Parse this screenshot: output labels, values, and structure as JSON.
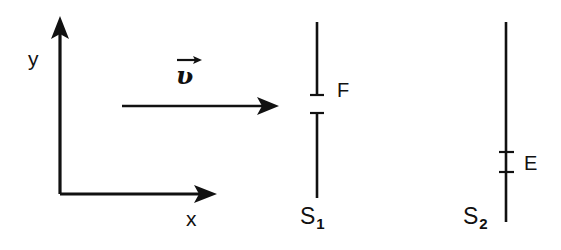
{
  "figure": {
    "kind": "physics-optics-diagram",
    "stroke_color": "#111111",
    "background_color": "#ffffff",
    "axes": {
      "y_label": "y",
      "x_label": "x",
      "origin": {
        "x": 60,
        "y": 194
      },
      "y_tip": {
        "x": 60,
        "y": 18
      },
      "x_tip": {
        "x": 215,
        "y": 194
      }
    },
    "vector": {
      "symbol": "ʋ",
      "accent": "right-arrow-overbar",
      "label_x": 176,
      "label_y": 57,
      "ray": {
        "x1": 122,
        "y1": 106,
        "x2": 277,
        "y2": 106
      }
    },
    "screens": [
      {
        "name": "S1",
        "label": "S",
        "subscript": "1",
        "line_x": 317,
        "top_segment": {
          "y1": 22,
          "y2": 95
        },
        "bottom_segment": {
          "y1": 113,
          "y2": 198
        },
        "label_x": 300,
        "label_y": 205,
        "aperture": {
          "name": "F",
          "label": "F",
          "label_x": 337,
          "label_y": 80,
          "y_top": 95,
          "y_bottom": 113
        }
      },
      {
        "name": "S2",
        "label": "S",
        "subscript": "2",
        "line_x": 506,
        "top_segment": {
          "y1": 22,
          "y2": 222
        },
        "label_x": 463,
        "label_y": 205,
        "aperture": {
          "name": "E",
          "label": "E",
          "label_x": 524,
          "label_y": 153,
          "y_top": 152,
          "y_bottom": 172
        }
      }
    ]
  }
}
